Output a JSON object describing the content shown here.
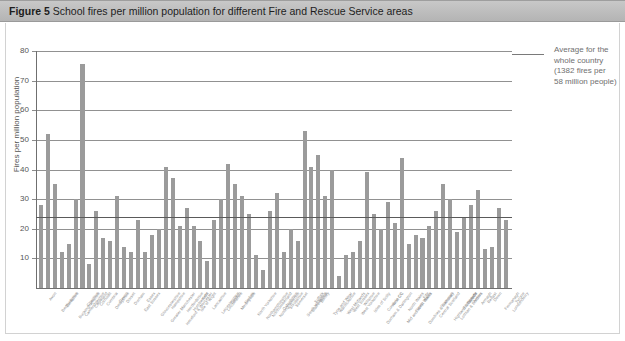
{
  "header": {
    "figure_number": "Figure 5",
    "title": "School fires per million population for different Fire and Rescue Service areas"
  },
  "legend": {
    "label_line1": "Average for the",
    "label_line2": "whole country",
    "label_line3": "(1382 fires per",
    "label_line4": "58 million people)",
    "full_text": "Average for the whole country (1382 fires per 58 million people)",
    "line_color": "#7a7a7a"
  },
  "colors": {
    "bar": "#9b9b9b",
    "gridline": "#7e7e7e",
    "axis": "#6f6f6f",
    "average_line": "#5a5a5a",
    "header_band": "#bdbdbd",
    "text": "#555555"
  },
  "chart_data": {
    "type": "bar",
    "title": "School fires per million population for different Fire and Rescue Service areas",
    "xlabel": "",
    "ylabel": "Fires per million population",
    "ylim": [
      0,
      80
    ],
    "yticks": [
      10,
      20,
      30,
      40,
      50,
      60,
      70,
      80
    ],
    "grid": true,
    "legend_position": "top-right",
    "average_value": 23.8,
    "average_label": "Average for the whole country (1382 fires per 58 million people)",
    "annotations": [
      "1382 fires per 58 million people"
    ],
    "categories": [
      "Avon",
      "Bedfordshire",
      "Berkshire",
      "Buckinghamshire",
      "Cambridgeshire",
      "Cheshire",
      "Cleveland",
      "Cornwall",
      "Cumbria",
      "Derbyshire",
      "Devon",
      "Dorset",
      "Durham",
      "East Sussex",
      "Essex",
      "Gloucestershire",
      "Greater Manchester",
      "Hampshire",
      "Hereford & Worcester",
      "Hertfordshire",
      "Humberside",
      "Isle of Wight",
      "Kent",
      "Lancashire",
      "Leicestershire",
      "Lincolnshire",
      "London",
      "Merseyside",
      "Norfolk",
      "North Yorkshire",
      "Northamptonshire",
      "Northumberland",
      "Nottinghamshire",
      "Oxfordshire",
      "Shropshire",
      "Somerset",
      "South Yorkshire",
      "Staffordshire",
      "Suffolk",
      "Surrey",
      "Tyne and Wear",
      "Warwickshire",
      "West Midlands",
      "West Sussex",
      "West Yorkshire",
      "Wiltshire",
      "Isles of Scilly",
      "Durham & Darlington",
      "Cumbria CC",
      "Avon CC",
      "Mid and West Wales",
      "North Wales",
      "South Wales",
      "Dumfries & Galloway",
      "Fife",
      "Central Scotland",
      "Grampian",
      "Highland & Islands",
      "Lothian & Borders",
      "Strathclyde",
      "Tayside",
      "Antrim",
      "Armagh",
      "Belfast",
      "Down",
      "Fermanagh",
      "Londonderry",
      "Tyrone"
    ],
    "values": [
      28,
      52,
      35,
      12,
      15,
      30,
      75.5,
      8,
      26,
      17,
      16,
      31,
      14,
      12,
      23,
      12,
      18,
      20,
      41,
      37,
      21,
      27,
      21,
      16,
      9,
      23,
      30,
      42,
      35,
      31,
      25,
      11,
      6,
      26,
      32,
      12,
      20,
      16,
      53,
      41,
      45,
      31,
      40,
      4,
      11,
      12,
      16,
      39,
      25,
      20,
      29,
      22,
      44,
      15,
      18,
      17,
      21,
      26,
      35,
      30,
      19,
      24,
      28,
      33,
      13,
      14,
      27,
      23
    ]
  }
}
